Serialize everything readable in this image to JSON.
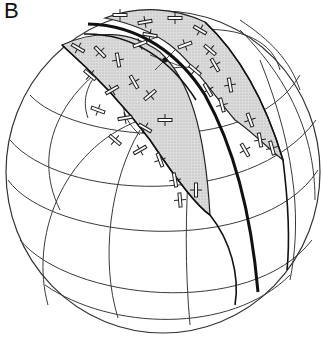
{
  "figure": {
    "panel_label": "B",
    "colors": {
      "band_fill": "#d9d9d9",
      "grid_line": "#3a3a3a",
      "bold_line": "#111111",
      "background": "#ffffff"
    },
    "elements": {
      "sphere": "sphere-outline",
      "grid": "latitude-longitude-grid",
      "left_band": "shaded-band-left",
      "right_band": "shaded-band-right",
      "great_circle": "bold-great-circle",
      "symbols": "strike-dip-symbols",
      "pole": "pole-point"
    }
  }
}
